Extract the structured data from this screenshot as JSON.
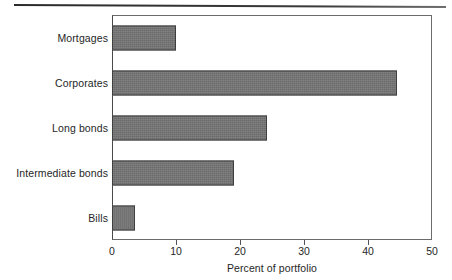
{
  "chart_data": {
    "type": "bar",
    "orientation": "horizontal",
    "title": "",
    "xlabel": "Percent of portfolio",
    "ylabel": "",
    "categories": [
      "Mortgages",
      "Corporates",
      "Long bonds",
      "Intermediate bonds",
      "Bills"
    ],
    "values": [
      10,
      44.5,
      24.2,
      19,
      3.6
    ],
    "xlim": [
      0,
      50
    ],
    "xticks": [
      0,
      10,
      20,
      30,
      40,
      50
    ],
    "xticklabels": [
      "0",
      "10",
      "20",
      "30",
      "40",
      "50"
    ],
    "grid": false,
    "legend": null,
    "bar_color": "#757575",
    "bar_edge_color": "#3f3f3f",
    "frame_color": "#6b6b6b"
  },
  "decor": {
    "top_rule": "horizontal-rule"
  }
}
